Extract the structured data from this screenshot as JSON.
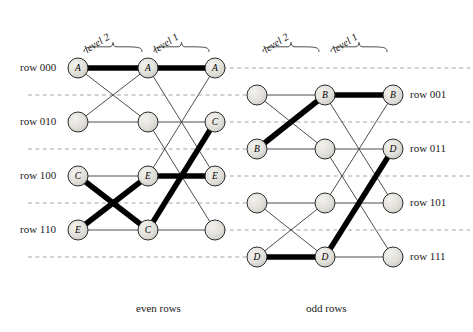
{
  "figure": {
    "title_absent": true,
    "captions": [
      {
        "id": "even",
        "text": "even rows",
        "x": 136,
        "y": 302
      },
      {
        "id": "odd",
        "text": "odd rows",
        "x": 306,
        "y": 302
      }
    ],
    "level_labels": [
      {
        "id": "left-level-2",
        "text": "level 2",
        "x": 88,
        "y": 44
      },
      {
        "id": "left-level-1",
        "text": "level 1",
        "x": 157,
        "y": 44
      },
      {
        "id": "right-level-2",
        "text": "level 2",
        "x": 267,
        "y": 44
      },
      {
        "id": "right-level-1",
        "text": "level 1",
        "x": 336,
        "y": 44
      }
    ],
    "braces": [
      {
        "id": "left-brace-level-2",
        "x0": 78,
        "x1": 148,
        "y": 52
      },
      {
        "id": "left-brace-level-1",
        "x0": 148,
        "x1": 215,
        "y": 52
      },
      {
        "id": "right-brace-level-2",
        "x0": 257,
        "x1": 325,
        "y": 52
      },
      {
        "id": "right-brace-level-1",
        "x0": 325,
        "x1": 393,
        "y": 52
      }
    ],
    "row_labels_left": [
      {
        "id": "row-000",
        "text": "row 000",
        "x": 20,
        "y": 68
      },
      {
        "id": "row-010",
        "text": "row 010",
        "x": 20,
        "y": 122
      },
      {
        "id": "row-100",
        "text": "row 100",
        "x": 20,
        "y": 176
      },
      {
        "id": "row-110",
        "text": "row 110",
        "x": 20,
        "y": 230
      }
    ],
    "row_labels_right": [
      {
        "id": "row-001",
        "text": "row 001",
        "x": 410,
        "y": 95
      },
      {
        "id": "row-011",
        "text": "row 011",
        "x": 410,
        "y": 149
      },
      {
        "id": "row-101",
        "text": "row 101",
        "x": 410,
        "y": 203
      },
      {
        "id": "row-111",
        "text": "row 111",
        "x": 410,
        "y": 257
      }
    ],
    "dashed_lines": [
      {
        "id": "dash-000",
        "y": 68,
        "x0": 215,
        "x1": 470
      },
      {
        "id": "dash-001",
        "y": 95,
        "x0": 28,
        "x1": 255
      },
      {
        "id": "dash-010",
        "y": 122,
        "x0": 215,
        "x1": 470
      },
      {
        "id": "dash-011",
        "y": 149,
        "x0": 28,
        "x1": 255
      },
      {
        "id": "dash-100",
        "y": 176,
        "x0": 215,
        "x1": 470
      },
      {
        "id": "dash-101",
        "y": 203,
        "x0": 28,
        "x1": 255
      },
      {
        "id": "dash-110",
        "y": 230,
        "x0": 215,
        "x1": 470
      },
      {
        "id": "dash-111",
        "y": 257,
        "x0": 28,
        "x1": 255
      }
    ],
    "node_radius": 10,
    "node_fill": "#dedcd6",
    "node_stroke": "#2a2a2a",
    "thin_edge_color": "#3a3a3a",
    "thick_edge_color": "#000000",
    "thin_edge_width": 0.9,
    "thick_edge_width": 5.5,
    "graphs": [
      {
        "id": "even-rows",
        "columns_x": [
          78,
          148,
          215
        ],
        "rows_y": [
          68,
          122,
          176,
          230
        ],
        "nodes": [
          {
            "id": "L-c0-r0",
            "col": 0,
            "row": 0,
            "label": "A"
          },
          {
            "id": "L-c0-r1",
            "col": 0,
            "row": 1,
            "label": ""
          },
          {
            "id": "L-c0-r2",
            "col": 0,
            "row": 2,
            "label": "C"
          },
          {
            "id": "L-c0-r3",
            "col": 0,
            "row": 3,
            "label": "E"
          },
          {
            "id": "L-c1-r0",
            "col": 1,
            "row": 0,
            "label": "A"
          },
          {
            "id": "L-c1-r1",
            "col": 1,
            "row": 1,
            "label": ""
          },
          {
            "id": "L-c1-r2",
            "col": 1,
            "row": 2,
            "label": "E"
          },
          {
            "id": "L-c1-r3",
            "col": 1,
            "row": 3,
            "label": "C"
          },
          {
            "id": "L-c2-r0",
            "col": 2,
            "row": 0,
            "label": "A"
          },
          {
            "id": "L-c2-r1",
            "col": 2,
            "row": 1,
            "label": "C"
          },
          {
            "id": "L-c2-r2",
            "col": 2,
            "row": 2,
            "label": "E"
          },
          {
            "id": "L-c2-r3",
            "col": 2,
            "row": 3,
            "label": ""
          }
        ],
        "edges": [
          {
            "c0": 0,
            "r0": 0,
            "c1": 1,
            "r1": 0,
            "w": "thick"
          },
          {
            "c0": 0,
            "r0": 0,
            "c1": 1,
            "r1": 1,
            "w": "thin"
          },
          {
            "c0": 0,
            "r0": 1,
            "c1": 1,
            "r1": 0,
            "w": "thin"
          },
          {
            "c0": 0,
            "r0": 1,
            "c1": 1,
            "r1": 1,
            "w": "thin"
          },
          {
            "c0": 0,
            "r0": 2,
            "c1": 1,
            "r1": 2,
            "w": "thin"
          },
          {
            "c0": 0,
            "r0": 2,
            "c1": 1,
            "r1": 3,
            "w": "thick"
          },
          {
            "c0": 0,
            "r0": 3,
            "c1": 1,
            "r1": 2,
            "w": "thick"
          },
          {
            "c0": 0,
            "r0": 3,
            "c1": 1,
            "r1": 3,
            "w": "thin"
          },
          {
            "c0": 1,
            "r0": 0,
            "c1": 2,
            "r1": 0,
            "w": "thick"
          },
          {
            "c0": 1,
            "r0": 0,
            "c1": 2,
            "r1": 2,
            "w": "thin"
          },
          {
            "c0": 1,
            "r0": 2,
            "c1": 2,
            "r1": 0,
            "w": "thin"
          },
          {
            "c0": 1,
            "r0": 2,
            "c1": 2,
            "r1": 2,
            "w": "thick"
          },
          {
            "c0": 1,
            "r0": 1,
            "c1": 2,
            "r1": 1,
            "w": "thin"
          },
          {
            "c0": 1,
            "r0": 1,
            "c1": 2,
            "r1": 3,
            "w": "thin"
          },
          {
            "c0": 1,
            "r0": 3,
            "c1": 2,
            "r1": 1,
            "w": "thick"
          },
          {
            "c0": 1,
            "r0": 3,
            "c1": 2,
            "r1": 3,
            "w": "thin"
          }
        ]
      },
      {
        "id": "odd-rows",
        "columns_x": [
          257,
          325,
          393
        ],
        "rows_y": [
          95,
          149,
          203,
          257
        ],
        "nodes": [
          {
            "id": "R-c0-r0",
            "col": 0,
            "row": 0,
            "label": ""
          },
          {
            "id": "R-c0-r1",
            "col": 0,
            "row": 1,
            "label": "B"
          },
          {
            "id": "R-c0-r2",
            "col": 0,
            "row": 2,
            "label": ""
          },
          {
            "id": "R-c0-r3",
            "col": 0,
            "row": 3,
            "label": "D"
          },
          {
            "id": "R-c1-r0",
            "col": 1,
            "row": 0,
            "label": "B"
          },
          {
            "id": "R-c1-r1",
            "col": 1,
            "row": 1,
            "label": ""
          },
          {
            "id": "R-c1-r2",
            "col": 1,
            "row": 2,
            "label": ""
          },
          {
            "id": "R-c1-r3",
            "col": 1,
            "row": 3,
            "label": "D"
          },
          {
            "id": "R-c2-r0",
            "col": 2,
            "row": 0,
            "label": "B"
          },
          {
            "id": "R-c2-r1",
            "col": 2,
            "row": 1,
            "label": "D"
          },
          {
            "id": "R-c2-r2",
            "col": 2,
            "row": 2,
            "label": ""
          },
          {
            "id": "R-c2-r3",
            "col": 2,
            "row": 3,
            "label": ""
          }
        ],
        "edges": [
          {
            "c0": 0,
            "r0": 0,
            "c1": 1,
            "r1": 0,
            "w": "thin"
          },
          {
            "c0": 0,
            "r0": 0,
            "c1": 1,
            "r1": 1,
            "w": "thin"
          },
          {
            "c0": 0,
            "r0": 1,
            "c1": 1,
            "r1": 0,
            "w": "thick"
          },
          {
            "c0": 0,
            "r0": 1,
            "c1": 1,
            "r1": 1,
            "w": "thin"
          },
          {
            "c0": 0,
            "r0": 2,
            "c1": 1,
            "r1": 2,
            "w": "thin"
          },
          {
            "c0": 0,
            "r0": 2,
            "c1": 1,
            "r1": 3,
            "w": "thin"
          },
          {
            "c0": 0,
            "r0": 3,
            "c1": 1,
            "r1": 2,
            "w": "thin"
          },
          {
            "c0": 0,
            "r0": 3,
            "c1": 1,
            "r1": 3,
            "w": "thick"
          },
          {
            "c0": 1,
            "r0": 0,
            "c1": 2,
            "r1": 0,
            "w": "thick"
          },
          {
            "c0": 1,
            "r0": 0,
            "c1": 2,
            "r1": 2,
            "w": "thin"
          },
          {
            "c0": 1,
            "r0": 2,
            "c1": 2,
            "r1": 0,
            "w": "thin"
          },
          {
            "c0": 1,
            "r0": 2,
            "c1": 2,
            "r1": 2,
            "w": "thin"
          },
          {
            "c0": 1,
            "r0": 1,
            "c1": 2,
            "r1": 1,
            "w": "thin"
          },
          {
            "c0": 1,
            "r0": 1,
            "c1": 2,
            "r1": 3,
            "w": "thin"
          },
          {
            "c0": 1,
            "r0": 3,
            "c1": 2,
            "r1": 1,
            "w": "thick"
          },
          {
            "c0": 1,
            "r0": 3,
            "c1": 2,
            "r1": 3,
            "w": "thin"
          }
        ]
      }
    ]
  }
}
